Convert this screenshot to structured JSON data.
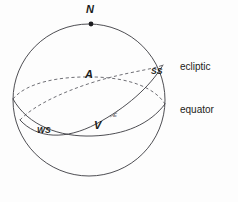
{
  "figure": {
    "background_color": "#fdfdfd",
    "line_color": "#3a3a40",
    "dashed_color": "#55555c"
  },
  "sphere": {
    "center_x": 89,
    "center_y": 100,
    "radius": 76
  },
  "points": {
    "north_pole": {
      "label": "N",
      "x": 91,
      "y": 24,
      "dot_x": 91,
      "dot_y": 24,
      "label_x": 86,
      "label_y": 4
    },
    "autumnal_equinox": {
      "label": "A",
      "x": 92,
      "y": 82,
      "label_x": 85,
      "label_y": 69
    },
    "vernal_equinox": {
      "label": "V",
      "x": 100,
      "y": 121,
      "label_x": 94,
      "label_y": 120
    },
    "summer_solstice": {
      "label": "SS",
      "x": 158,
      "y": 73,
      "label_x": 151,
      "label_y": 67
    },
    "winter_solstice": {
      "label": "WS",
      "x": 44,
      "y": 131,
      "label_x": 37,
      "label_y": 126
    },
    "obliquity_angle": {
      "label": "E",
      "label_x": 113,
      "label_y": 112
    }
  },
  "curves": {
    "equator": {
      "label": "equator",
      "label_x": 180,
      "label_y": 105,
      "front_path": "M 13 99 C 28 126 60 137 92 136 C 125 135 150 124 165 104",
      "back_path": "M 13 99 C 26 83 58 76 95 77 C 130 78 155 88 165 104"
    },
    "ecliptic": {
      "label": "ecliptic",
      "label_x": 180,
      "label_y": 62,
      "front_path": "M 20 120 C 37 139 66 140 96 124 C 126 108 150 87 163 65",
      "back_path": "M 20 120 C 33 106 62 92 94 82 C 126 72 151 70 163 65"
    }
  },
  "angle_arc": {
    "path": "M 110 117 A 14 14 0 0 0 118 110"
  }
}
